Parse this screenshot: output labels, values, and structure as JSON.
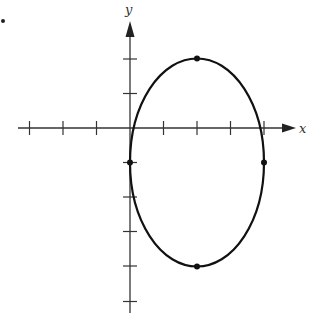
{
  "figure": {
    "marker": "•",
    "axes": {
      "x_label": "x",
      "y_label": "y",
      "x_ticks": [
        -3,
        -2,
        -1,
        1,
        2,
        3,
        4
      ],
      "y_ticks": [
        2,
        1,
        -1,
        -2,
        -3,
        -4,
        -5
      ]
    },
    "ellipse": {
      "center": [
        2,
        -1
      ],
      "semi_axis_x": 2,
      "semi_axis_y": 3,
      "marked_points": [
        [
          0,
          -1
        ],
        [
          4,
          -1
        ],
        [
          2,
          2
        ],
        [
          2,
          -4
        ]
      ]
    },
    "colors": {
      "stroke": "#111111",
      "axis": "#333333"
    }
  }
}
